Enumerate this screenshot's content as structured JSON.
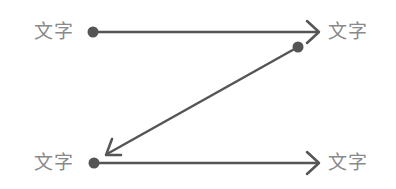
{
  "diagram": {
    "type": "z-flow",
    "stroke_color": "#555555",
    "label_color": "#8a8a8a",
    "labels": {
      "top_left": "文字",
      "top_right": "文字",
      "bottom_left": "文字",
      "bottom_right": "文字"
    },
    "arrows": [
      {
        "from": [
          93,
          32
        ],
        "to": [
          318,
          32
        ],
        "direction": "right"
      },
      {
        "from": [
          298,
          47
        ],
        "to": [
          106,
          154
        ],
        "direction": "down-left"
      },
      {
        "from": [
          94,
          163
        ],
        "to": [
          318,
          163
        ],
        "direction": "right"
      }
    ]
  }
}
